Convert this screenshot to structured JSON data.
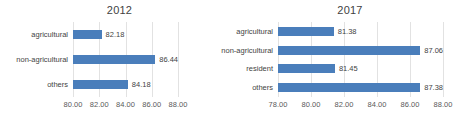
{
  "chart_data": [
    {
      "type": "bar",
      "orientation": "horizontal",
      "title": "2012",
      "categories": [
        "agricultural",
        "non-agricultural",
        "others"
      ],
      "values": [
        82.18,
        84.44,
        84.18
      ],
      "value_labels": [
        "82.18",
        "86.44",
        "84.18"
      ],
      "real_values": [
        82.18,
        86.44,
        84.18
      ],
      "xlabel": "",
      "ylabel": "",
      "xlim": [
        80.0,
        88.0
      ],
      "ticks": [
        "80.00",
        "82.00",
        "84.00",
        "86.00",
        "88.00"
      ],
      "tick_values": [
        80.0,
        82.0,
        84.0,
        86.0,
        88.0
      ],
      "grid": true,
      "legend": false,
      "bar_color": "#4a7ebb"
    },
    {
      "type": "bar",
      "orientation": "horizontal",
      "title": "2017",
      "categories": [
        "agricultural",
        "non-agricultural",
        "resident",
        "others"
      ],
      "values": [
        81.38,
        87.06,
        81.45,
        87.38
      ],
      "value_labels": [
        "81.38",
        "87.06",
        "81.45",
        "87.38"
      ],
      "real_values": [
        81.38,
        87.06,
        81.45,
        87.38
      ],
      "xlabel": "",
      "ylabel": "",
      "xlim": [
        78.0,
        88.0
      ],
      "ticks": [
        "78.00",
        "80.00",
        "82.00",
        "84.00",
        "86.00",
        "88.00"
      ],
      "tick_values": [
        78.0,
        80.0,
        82.0,
        84.0,
        86.0,
        88.0
      ],
      "grid": true,
      "legend": false,
      "bar_color": "#4a7ebb"
    }
  ]
}
